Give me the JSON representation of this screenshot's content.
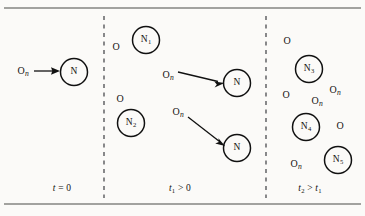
{
  "figure": {
    "kind": "nuclear-decay-time-evolution-diagram",
    "background_color": "#fbfaf8",
    "ink_color": "#111111",
    "width": 365,
    "height": 216,
    "top_rule_y": 8,
    "bottom_rule_y": 204,
    "dividers": [
      {
        "name": "divider-1",
        "x": 104,
        "y1": 16,
        "y2": 198
      },
      {
        "name": "divider-2",
        "x": 266,
        "y1": 16,
        "y2": 198
      }
    ]
  },
  "panels": [
    {
      "id": "panel-t0",
      "time_label": {
        "t": "t",
        "sub": "",
        "relation": "= 0",
        "x": 62,
        "y": 189
      },
      "nuclei": [
        {
          "name": "N",
          "sub": "",
          "cx": 74,
          "cy": 72,
          "r": 13.5
        }
      ],
      "neutrons": [
        {
          "label": "O",
          "sub": "n",
          "x": 23,
          "y": 71
        }
      ],
      "arrows": [
        {
          "x1": 34,
          "y1": 71,
          "x2": 58,
          "y2": 71
        }
      ]
    },
    {
      "id": "panel-t1",
      "time_label": {
        "t": "t",
        "sub": "1",
        "relation": "> 0",
        "x": 180,
        "y": 189
      },
      "nuclei": [
        {
          "name": "N",
          "sub": "1",
          "cx": 146,
          "cy": 40,
          "r": 13.5
        },
        {
          "name": "N",
          "sub": "2",
          "cx": 131,
          "cy": 123,
          "r": 13.5
        },
        {
          "name": "N",
          "sub": "",
          "cx": 237,
          "cy": 83,
          "r": 13.5
        },
        {
          "name": "N",
          "sub": "",
          "cx": 237,
          "cy": 148,
          "r": 13.5
        }
      ],
      "neutrons": [
        {
          "label": "O",
          "sub": "",
          "x": 116,
          "y": 47
        },
        {
          "label": "O",
          "sub": "",
          "x": 120,
          "y": 99
        },
        {
          "label": "O",
          "sub": "n",
          "x": 168,
          "y": 75
        },
        {
          "label": "O",
          "sub": "n",
          "x": 178,
          "y": 112
        }
      ],
      "arrows": [
        {
          "x1": 178,
          "y1": 72,
          "x2": 222,
          "y2": 83
        },
        {
          "x1": 188,
          "y1": 117,
          "x2": 224,
          "y2": 145
        }
      ]
    },
    {
      "id": "panel-t2",
      "time_label": {
        "t": "t",
        "sub": "2",
        "relation": "> t",
        "relation_sub": "1",
        "x": 310,
        "y": 189
      },
      "nuclei": [
        {
          "name": "N",
          "sub": "3",
          "cx": 309,
          "cy": 69,
          "r": 13.5
        },
        {
          "name": "N",
          "sub": "4",
          "cx": 306,
          "cy": 127,
          "r": 13.5
        },
        {
          "name": "N",
          "sub": "5",
          "cx": 338,
          "cy": 160,
          "r": 13.5
        },
        {
          "name": "N",
          "sub": "",
          "cx": 237,
          "cy": 83,
          "r": 0
        }
      ],
      "neutrons": [
        {
          "label": "O",
          "sub": "",
          "x": 287,
          "y": 41
        },
        {
          "label": "O",
          "sub": "n",
          "x": 335,
          "y": 90
        },
        {
          "label": "O",
          "sub": "",
          "x": 286,
          "y": 95
        },
        {
          "label": "O",
          "sub": "n",
          "x": 317,
          "y": 101
        },
        {
          "label": "O",
          "sub": "",
          "x": 340,
          "y": 126
        },
        {
          "label": "O",
          "sub": "n",
          "x": 296,
          "y": 164
        }
      ],
      "arrows": []
    }
  ]
}
